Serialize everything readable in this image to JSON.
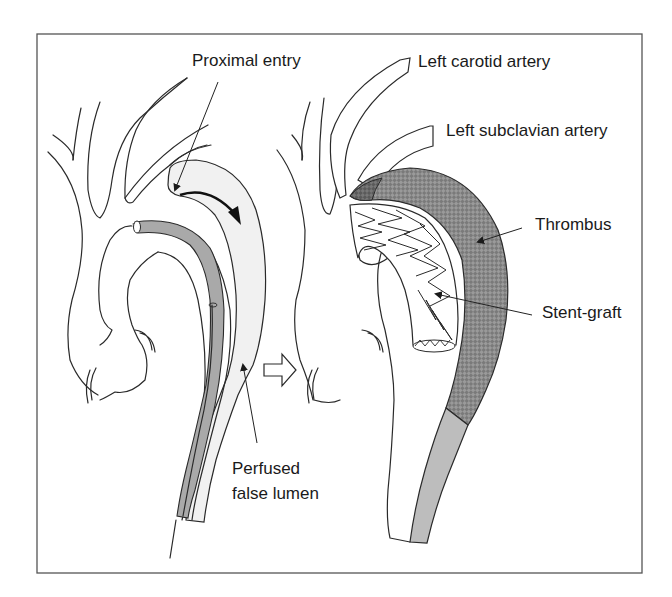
{
  "figure": {
    "frame": {
      "x": 37,
      "y": 34,
      "width": 605,
      "height": 539,
      "stroke": "#555555"
    },
    "colors": {
      "false_lumen_fill": "#f1f1f1",
      "catheter_fill": "#a9a9a9",
      "thrombus_fill": "#8e8e8e",
      "distal_false_lumen_fill": "#bdbdbd",
      "line": "#2a2a2a"
    },
    "left_panel": {
      "title": "Before stent-graft",
      "labels": {
        "proximal_entry": "Proximal entry",
        "perfused_false_lumen_line1": "Perfused",
        "perfused_false_lumen_line2": "false lumen"
      }
    },
    "transition_arrow": {
      "icon": "right-arrow-icon"
    },
    "right_panel": {
      "title": "After stent-graft",
      "labels": {
        "left_carotid_artery": "Left carotid artery",
        "left_subclavian_artery": "Left subclavian artery",
        "thrombus": "Thrombus",
        "stent_graft": "Stent-graft"
      }
    }
  }
}
